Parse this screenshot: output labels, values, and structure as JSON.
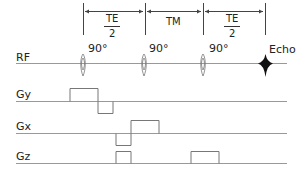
{
  "diagram": {
    "type": "pulse-sequence",
    "intervals": [
      {
        "label_num": "TE",
        "label_den": "2",
        "from_x": 83,
        "to_x": 145
      },
      {
        "label": "TM",
        "from_x": 145,
        "to_x": 203
      },
      {
        "label_num": "TE",
        "label_den": "2",
        "from_x": 203,
        "to_x": 265
      }
    ],
    "rf": {
      "label": "RF",
      "pulses": [
        {
          "label": "90°",
          "x": 83
        },
        {
          "label": "90°",
          "x": 145
        },
        {
          "label": "90°",
          "x": 203
        }
      ],
      "echo": {
        "label": "Echo",
        "x": 265
      }
    },
    "gradients": [
      {
        "label": "Gy",
        "baseline_y": 101
      },
      {
        "label": "Gx",
        "baseline_y": 133
      },
      {
        "label": "Gz",
        "baseline_y": 163
      }
    ]
  }
}
